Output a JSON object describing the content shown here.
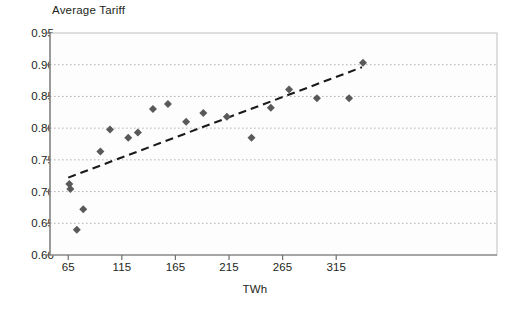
{
  "chart_data": {
    "type": "scatter",
    "title": "Average Tariff",
    "xlabel": "TWh",
    "ylabel": "",
    "xlim": [
      48,
      465
    ],
    "ylim": [
      0.6,
      0.95
    ],
    "xticks": [
      65,
      115,
      165,
      215,
      265,
      315
    ],
    "yticks": [
      0.6,
      0.65,
      0.7,
      0.75,
      0.8,
      0.85,
      0.9,
      0.95
    ],
    "xtick_labels": [
      "65",
      "115",
      "165",
      "215",
      "265",
      "315"
    ],
    "ytick_labels": [
      "0.60",
      "0.65",
      "0.70",
      "0.75",
      "0.80",
      "0.85",
      "0.90",
      "0.95"
    ],
    "grid": "horizontal-dotted",
    "legend": null,
    "marker": "diamond",
    "marker_color": "#595959",
    "series": [
      {
        "name": "Average Tariff vs TWh",
        "points": [
          {
            "x": 66,
            "y": 0.712
          },
          {
            "x": 67,
            "y": 0.704
          },
          {
            "x": 73,
            "y": 0.64
          },
          {
            "x": 79,
            "y": 0.672
          },
          {
            "x": 95,
            "y": 0.763
          },
          {
            "x": 104,
            "y": 0.798
          },
          {
            "x": 121,
            "y": 0.785
          },
          {
            "x": 130,
            "y": 0.793
          },
          {
            "x": 144,
            "y": 0.83
          },
          {
            "x": 158,
            "y": 0.838
          },
          {
            "x": 175,
            "y": 0.81
          },
          {
            "x": 191,
            "y": 0.824
          },
          {
            "x": 213,
            "y": 0.818
          },
          {
            "x": 236,
            "y": 0.785
          },
          {
            "x": 254,
            "y": 0.832
          },
          {
            "x": 271,
            "y": 0.861
          },
          {
            "x": 297,
            "y": 0.847
          },
          {
            "x": 327,
            "y": 0.847
          },
          {
            "x": 340,
            "y": 0.903
          }
        ]
      }
    ],
    "trendline": {
      "style": "dashed",
      "color": "#1a1a1a",
      "x_start": 65,
      "y_start": 0.722,
      "x_end": 339,
      "y_end": 0.896
    }
  }
}
